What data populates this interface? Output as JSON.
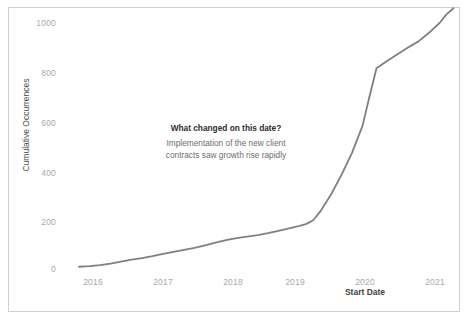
{
  "chart_data": {
    "type": "line",
    "title": "",
    "subtitle": "",
    "xlabel": "Start Date",
    "ylabel": "Cumulative Occurrences",
    "xlim": [
      "2015-09",
      "2021-04"
    ],
    "ylim": [
      0,
      1100
    ],
    "grid": false,
    "legend": null,
    "legend_position": "none",
    "line_color": "#808080",
    "line_width": 1.8,
    "ytick_labels": [
      "0",
      "200",
      "400",
      "600",
      "800",
      "1000"
    ],
    "ytick_values": [
      0,
      200,
      400,
      600,
      800,
      1000
    ],
    "xtick_labels": [
      "2016",
      "2017",
      "2018",
      "2019",
      "2020",
      "2021"
    ],
    "xtick_values": [
      2016,
      2017,
      2018,
      2019,
      2020,
      2021
    ],
    "series": [
      {
        "name": "Cumulative Occurrences",
        "x": [
          2015.8,
          2015.95,
          2016.1,
          2016.25,
          2016.4,
          2016.55,
          2016.7,
          2016.85,
          2017.0,
          2017.15,
          2017.3,
          2017.45,
          2017.6,
          2017.75,
          2017.9,
          2018.05,
          2018.2,
          2018.35,
          2018.5,
          2018.65,
          2018.8,
          2018.95,
          2019.05,
          2019.15,
          2019.25,
          2019.4,
          2019.55,
          2019.7,
          2019.85,
          2019.95,
          2020.05,
          2020.2,
          2020.35,
          2020.5,
          2020.65,
          2020.8,
          2020.95,
          2021.05,
          2021.15
        ],
        "y": [
          5,
          8,
          12,
          18,
          26,
          34,
          40,
          48,
          58,
          66,
          74,
          82,
          92,
          104,
          114,
          122,
          128,
          134,
          142,
          152,
          162,
          172,
          180,
          196,
          232,
          300,
          380,
          470,
          580,
          700,
          815,
          845,
          872,
          900,
          925,
          960,
          1000,
          1035,
          1060
        ]
      }
    ],
    "annotation": {
      "title": "What changed on this date?",
      "body": "Implementation of the new client contracts saw growth rise rapidly"
    }
  },
  "axes": {
    "y_title": "Cumulative Occurrences",
    "x_title": "Start Date",
    "y_ticks": [
      {
        "label": "1000",
        "value": 1000
      },
      {
        "label": "800",
        "value": 800
      },
      {
        "label": "600",
        "value": 600
      },
      {
        "label": "400",
        "value": 400
      },
      {
        "label": "200",
        "value": 200
      },
      {
        "label": "0",
        "value": 0
      }
    ],
    "x_ticks": [
      {
        "label": "2016",
        "value": 2016
      },
      {
        "label": "2017",
        "value": 2017
      },
      {
        "label": "2018",
        "value": 2018
      },
      {
        "label": "2019",
        "value": 2019
      },
      {
        "label": "2020",
        "value": 2020
      },
      {
        "label": "2021",
        "value": 2021
      }
    ]
  },
  "annotation": {
    "title": "What changed on this date?",
    "body": "Implementation of the new client contracts saw growth rise rapidly"
  },
  "colors": {
    "line": "#808080",
    "frame": "#cfcfcf",
    "tick_text": "#a9a9a9",
    "axis_title": "#3f3f3f",
    "annotation_title": "#2c2c2c",
    "annotation_body": "#6d6d6d",
    "background": "#ffffff"
  }
}
